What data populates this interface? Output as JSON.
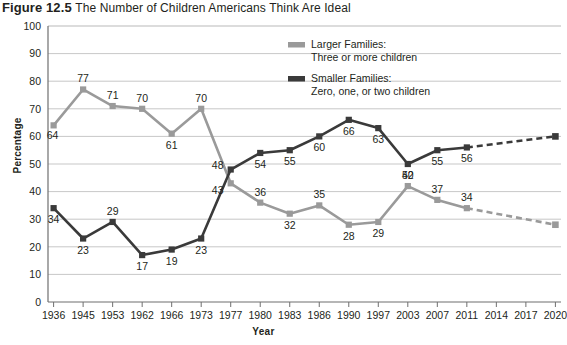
{
  "figure": {
    "number": "Figure 12.5",
    "title": "The Number of Children Americans Think Are Ideal"
  },
  "axes": {
    "ylabel": "Percentage",
    "xlabel": "Year"
  },
  "legend": {
    "larger_line1": "Larger Families:",
    "larger_line2": "Three or more children",
    "smaller_line1": "Smaller Families:",
    "smaller_line2": "Zero, one, or two children"
  },
  "colors": {
    "larger": "#9a9a9a",
    "smaller": "#3a3a3a",
    "grid": "#b9b9b9",
    "axis": "#6f6f6f",
    "text": "#231f20"
  },
  "chart_data": {
    "type": "line",
    "title": "The Number of Children Americans Think Are Ideal",
    "xlabel": "Year",
    "ylabel": "Percentage",
    "ylim": [
      0,
      100
    ],
    "yticks": [
      0,
      10,
      20,
      30,
      40,
      50,
      60,
      70,
      80,
      90,
      100
    ],
    "grid": true,
    "legend_position": "top-center",
    "categories": [
      "1936",
      "1945",
      "1953",
      "1962",
      "1966",
      "1973",
      "1977",
      "1980",
      "1983",
      "1986",
      "1990",
      "1997",
      "2003",
      "2007",
      "2011",
      "2014",
      "2017",
      "2020"
    ],
    "series": [
      {
        "name": "Larger Families: Three or more children",
        "color": "#9a9a9a",
        "values": [
          64,
          77,
          71,
          70,
          61,
          70,
          43,
          36,
          32,
          35,
          28,
          29,
          42,
          37,
          34,
          33,
          null,
          28
        ],
        "labels": [
          "64",
          "77",
          "71",
          "70",
          "61",
          "70",
          "43",
          "36",
          "32",
          "35",
          "28",
          "29",
          "42",
          "37",
          "34",
          "33",
          "",
          ""
        ],
        "projected_from": "2011",
        "projected_to_value": 28
      },
      {
        "name": "Smaller Families: Zero, one, or two children",
        "color": "#3a3a3a",
        "values": [
          34,
          23,
          29,
          17,
          19,
          23,
          48,
          54,
          55,
          60,
          66,
          63,
          50,
          55,
          56,
          58,
          null,
          60
        ],
        "labels": [
          "34",
          "23",
          "29",
          "17",
          "19",
          "23",
          "48",
          "54",
          "55",
          "60",
          "66",
          "63",
          "50",
          "55",
          "56",
          "58",
          "",
          ""
        ],
        "projected_from": "2011",
        "projected_to_value": 60
      }
    ]
  }
}
